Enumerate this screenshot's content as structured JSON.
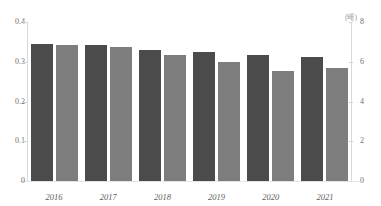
{
  "chart_data": {
    "type": "bar",
    "title": "",
    "xlabel": "",
    "ylabel": "",
    "categories": [
      "2016",
      "2017",
      "2018",
      "2019",
      "2020",
      "2021"
    ],
    "series": [
      {
        "name": "dark-series",
        "axis": "left",
        "color": "#4b4b4b",
        "values": [
          0.345,
          0.341,
          0.329,
          0.324,
          0.316,
          0.313
        ]
      },
      {
        "name": "light-series",
        "axis": "right",
        "color": "#7d7d7d",
        "values": [
          6.85,
          6.72,
          6.35,
          6.0,
          5.55,
          5.7
        ]
      }
    ],
    "left_axis": {
      "ticks": [
        "0",
        "0.1",
        "0.2",
        "0.3",
        "0.4"
      ],
      "values": [
        0,
        0.1,
        0.2,
        0.3,
        0.4
      ],
      "ylim": [
        0,
        0.4
      ],
      "unit": ""
    },
    "right_axis": {
      "ticks": [
        "0",
        "2",
        "4",
        "6",
        "8"
      ],
      "values": [
        0,
        2,
        4,
        6,
        8
      ],
      "ylim": [
        0,
        8
      ],
      "unit": "(배)"
    },
    "grid": false,
    "legend": null
  },
  "unit_label": "(배)"
}
